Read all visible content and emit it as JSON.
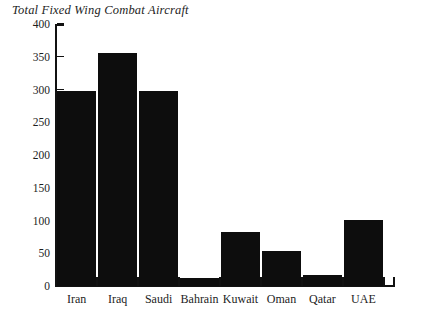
{
  "chart_data": {
    "type": "bar",
    "title": "Total Fixed Wing Combat Aircraft",
    "xlabel": "",
    "ylabel": "",
    "categories": [
      "Iran",
      "Iraq",
      "Saudi",
      "Bahrain",
      "Kuwait",
      "Oman",
      "Qatar",
      "UAE"
    ],
    "values": [
      298,
      356,
      298,
      12,
      83,
      53,
      17,
      101
    ],
    "ylim": [
      0,
      400
    ],
    "ytick_step": 50,
    "yticks": [
      0,
      50,
      100,
      150,
      200,
      250,
      300,
      350,
      400
    ],
    "ytick_labels": [
      "0",
      "50",
      "100",
      "150",
      "200",
      "250",
      "300",
      "350",
      "400"
    ],
    "grid": false,
    "legend": null,
    "bar_color": "#0d0d0d",
    "axis_color": "#111111",
    "background_color": "#ffffff"
  }
}
